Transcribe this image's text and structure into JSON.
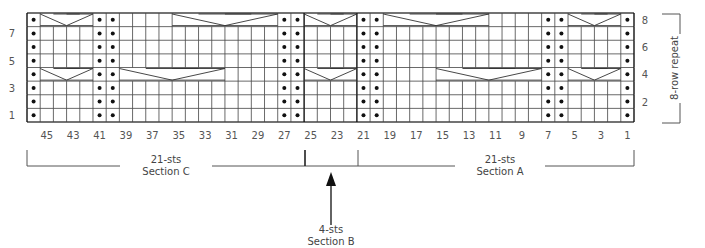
{
  "chart_data": {
    "type": "knitting-chart",
    "title": "",
    "columns": 46,
    "rows": 8,
    "col_labels": [
      "45",
      "43",
      "41",
      "39",
      "37",
      "35",
      "33",
      "31",
      "29",
      "27",
      "25",
      "23",
      "21",
      "19",
      "17",
      "15",
      "13",
      "11",
      "9",
      "7",
      "5",
      "3",
      "1"
    ],
    "col_label_values": [
      45,
      43,
      41,
      39,
      37,
      35,
      33,
      31,
      29,
      27,
      25,
      23,
      21,
      19,
      17,
      15,
      13,
      11,
      9,
      7,
      5,
      3,
      1
    ],
    "row_labels_left": [
      "1",
      "3",
      "5",
      "7"
    ],
    "row_labels_left_values": [
      1,
      3,
      5,
      7
    ],
    "row_labels_right": [
      "2",
      "4",
      "6",
      "8"
    ],
    "row_labels_right_values": [
      2,
      4,
      6,
      8
    ],
    "purl_columns": [
      46,
      41,
      40,
      27,
      26,
      21,
      20,
      7,
      6,
      1
    ],
    "cables": [
      {
        "row": 8,
        "from": 45,
        "to": 42
      },
      {
        "row": 8,
        "from": 35,
        "to": 28
      },
      {
        "row": 8,
        "from": 25,
        "to": 22
      },
      {
        "row": 8,
        "from": 19,
        "to": 12
      },
      {
        "row": 8,
        "from": 5,
        "to": 2
      },
      {
        "row": 4,
        "from": 45,
        "to": 42
      },
      {
        "row": 4,
        "from": 39,
        "to": 32
      },
      {
        "row": 4,
        "from": 25,
        "to": 22
      },
      {
        "row": 4,
        "from": 15,
        "to": 8
      },
      {
        "row": 4,
        "from": 5,
        "to": 2
      }
    ],
    "section_dividers_after_col": [
      26,
      22
    ],
    "sections": [
      {
        "name": "Section C",
        "count": "21-sts",
        "from": 46,
        "to": 26
      },
      {
        "name": "Section B",
        "count": "4-sts",
        "from": 25,
        "to": 22
      },
      {
        "name": "Section A",
        "count": "21-sts",
        "from": 21,
        "to": 1
      }
    ],
    "repeat_label": "8-row repeat"
  },
  "labels": {
    "section_c_count": "21-sts",
    "section_c_name": "Section C",
    "section_a_count": "21-sts",
    "section_a_name": "Section A",
    "section_b_count": "4-sts",
    "section_b_name": "Section B",
    "repeat": "8-row repeat"
  },
  "colors": {
    "grid": "#333333",
    "text": "#555555",
    "dot": "#111111"
  }
}
